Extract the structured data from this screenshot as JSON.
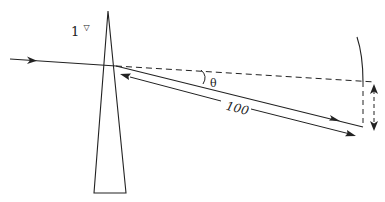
{
  "diagram": {
    "type": "prism-deviation",
    "prism_label": "1",
    "prism_unit_symbol": "▽",
    "angle_label": "θ",
    "distance_label": "100",
    "displacement_label": "1",
    "colors": {
      "line": "#222222",
      "background": "#ffffff"
    }
  }
}
